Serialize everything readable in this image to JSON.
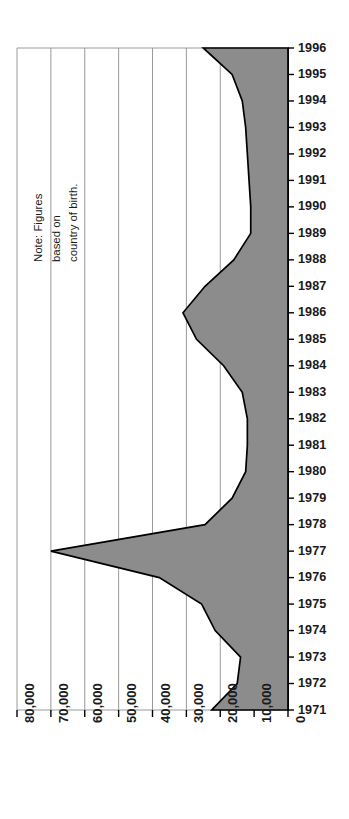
{
  "chart_data": {
    "type": "area",
    "orientation": "horizontal",
    "title": "",
    "subtitle": "",
    "xlabel": "",
    "ylabel": "",
    "grid": true,
    "legend": null,
    "note": "Note: Figures\nbased on\ncountry of birth.",
    "value_axis": {
      "position": "bottom",
      "reversed": true,
      "min": 0,
      "max": 80000,
      "tick_step": 10000,
      "tick_labels": [
        "80,000",
        "70,000",
        "60,000",
        "50,000",
        "40,000",
        "30,000",
        "20,000",
        "10,000",
        "0"
      ],
      "tick_values": [
        80000,
        70000,
        60000,
        50000,
        40000,
        30000,
        20000,
        10000,
        0
      ]
    },
    "category_axis": {
      "position": "right",
      "label": "Year",
      "tick_labels": [
        "1996",
        "1995",
        "1994",
        "1993",
        "1992",
        "1991",
        "1990",
        "1989",
        "1988",
        "1987",
        "1986",
        "1985",
        "1984",
        "1983",
        "1982",
        "1981",
        "1980",
        "1979",
        "1978",
        "1977",
        "1976",
        "1975",
        "1974",
        "1973",
        "1972",
        "1971"
      ]
    },
    "categories": [
      1996,
      1995,
      1994,
      1993,
      1992,
      1991,
      1990,
      1989,
      1988,
      1987,
      1986,
      1985,
      1984,
      1983,
      1982,
      1981,
      1980,
      1979,
      1978,
      1977,
      1976,
      1975,
      1974,
      1973,
      1972,
      1971
    ],
    "values": [
      25000,
      16500,
      13500,
      12500,
      12000,
      11500,
      11000,
      11000,
      16000,
      24500,
      31000,
      27000,
      19000,
      13500,
      12000,
      12000,
      12500,
      16500,
      24500,
      70000,
      38000,
      25500,
      21500,
      14000,
      15000,
      22500
    ],
    "series": [
      {
        "name": "Immigrants",
        "values": [
          25000,
          16500,
          13500,
          12500,
          12000,
          11500,
          11000,
          11000,
          16000,
          24500,
          31000,
          27000,
          19000,
          13500,
          12000,
          12000,
          12500,
          16500,
          24500,
          70000,
          38000,
          25500,
          21500,
          14000,
          15000,
          22500
        ]
      }
    ],
    "colors": {
      "fill": "#8c8c8c",
      "stroke": "#000000",
      "grid": "#9a9a9a",
      "axis": "#000000",
      "text": "#1a1a1a"
    }
  },
  "geometry": {
    "x0": 288,
    "x80k": 17,
    "yTop": 48,
    "yBottom": 710
  }
}
